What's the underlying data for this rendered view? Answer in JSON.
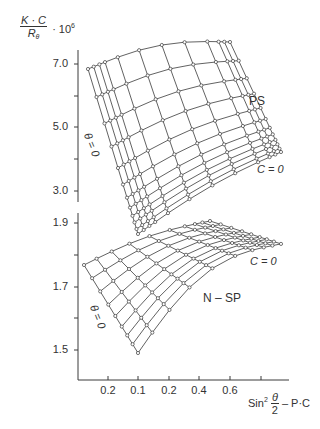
{
  "chart_data": [
    {
      "type": "surface-grid",
      "title": "PS",
      "ylabel": "(K·C / R_θ) · 10^6",
      "yticks": [
        "7.0",
        "5.0",
        "3.0"
      ],
      "ylim": [
        3.0,
        7.0
      ],
      "annotations": [
        "PS",
        "C = 0",
        "θ = 0"
      ],
      "approx_values": {
        "theta0_edge_C_max": 6.8,
        "theta0_edge_C0": 2.6,
        "theta_max_edge_C_max": 7.5,
        "theta_max_edge_C0": 4.1
      }
    },
    {
      "type": "surface-grid",
      "title": "N – SP",
      "ylabel": "(K·C / R_θ) · 10^6",
      "yticks": [
        "1.9",
        "1.7",
        "1.5"
      ],
      "ylim": [
        1.5,
        1.9
      ],
      "annotations": [
        "N – SP",
        "C = 0",
        "θ = 0"
      ],
      "approx_values": {
        "theta0_edge_C_max": 1.76,
        "theta0_edge_C0": 1.49,
        "crest": 1.9,
        "theta_max_edge_C0": 1.84
      }
    }
  ],
  "axes": {
    "y_label_num": "K · C",
    "y_label_den": "R",
    "y_label_den_sub": "θ",
    "y_label_mult": "· 10",
    "y_label_exp": "6",
    "upper_ticks": [
      {
        "label": "7.0",
        "y": 64
      },
      {
        "label": "",
        "y": 96
      },
      {
        "label": "5.0",
        "y": 127
      },
      {
        "label": "",
        "y": 159
      },
      {
        "label": "3.0",
        "y": 191
      }
    ],
    "lower_ticks": [
      {
        "label": "1.9",
        "y": 223
      },
      {
        "label": "",
        "y": 255
      },
      {
        "label": "1.7",
        "y": 287
      },
      {
        "label": "",
        "y": 318
      },
      {
        "label": "1.5",
        "y": 350
      }
    ],
    "x_ticks": [
      {
        "label": "0.2",
        "x": 108
      },
      {
        "label": "0.1",
        "x": 138
      },
      {
        "label": "0.2",
        "x": 169
      },
      {
        "label": "0.4",
        "x": 199
      },
      {
        "label": "0.6",
        "x": 230
      },
      {
        "label": "",
        "x": 261
      }
    ],
    "x_label_prefix": "Sin",
    "x_label_exp": "2",
    "x_label_num": "θ",
    "x_label_den": "2",
    "x_label_suffix": "– P·C"
  },
  "labels": {
    "ps": "PS",
    "nsp": "N – SP",
    "c0_upper": "C = 0",
    "c0_lower": "C = 0",
    "theta0_upper": "θ = 0",
    "theta0_lower": "θ = 0"
  },
  "colors": {
    "line": "#3a3a3a",
    "marker_fill": "#ffffff",
    "text": "#333333"
  }
}
